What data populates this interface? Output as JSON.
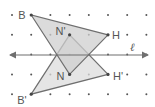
{
  "diagram": {
    "line_label": "ℓ",
    "grid": {
      "cols": 8,
      "rows": 5
    },
    "original": {
      "vertices": [
        {
          "name": "B",
          "label": "B",
          "col": 1,
          "row": 0
        },
        {
          "name": "N",
          "label": "N",
          "col": 3,
          "row": 3
        },
        {
          "name": "H",
          "label": "H",
          "col": 5,
          "row": 1
        }
      ]
    },
    "image": {
      "vertices": [
        {
          "name": "B'",
          "label": "B'",
          "col": 1,
          "row": 4
        },
        {
          "name": "N'",
          "label": "N'",
          "col": 3,
          "row": 1
        },
        {
          "name": "H'",
          "label": "H'",
          "col": 5,
          "row": 3
        }
      ]
    },
    "colors": {
      "fill_original": "#cfcfcf",
      "fill_image": "#dcdcdc",
      "overlap": "#b3b3b3",
      "stroke": "#6f6f6f",
      "dot": "#555555"
    }
  }
}
